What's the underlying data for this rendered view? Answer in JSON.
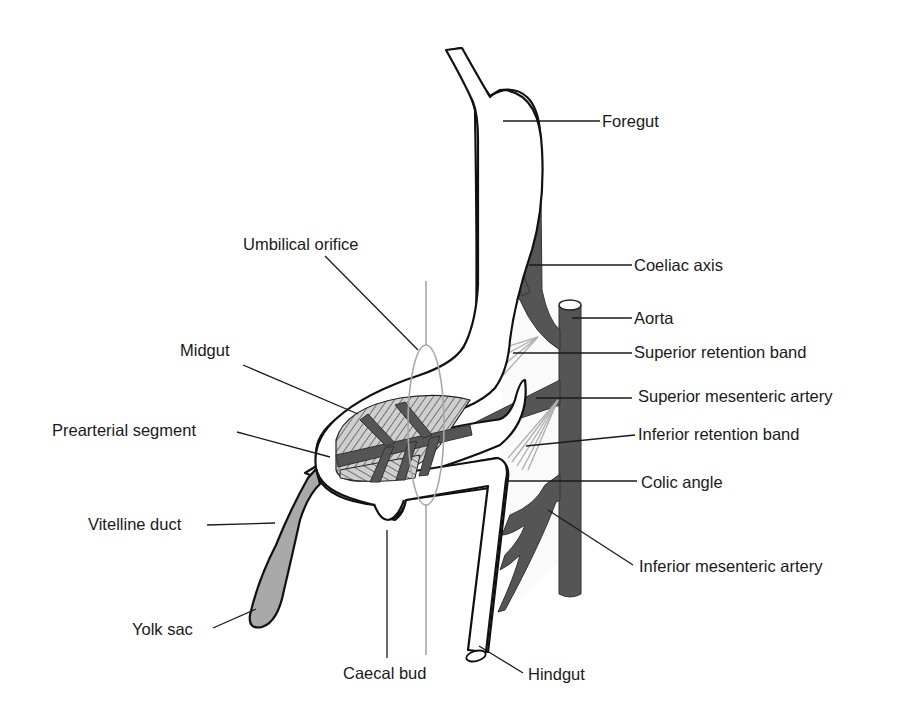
{
  "figure": {
    "colors": {
      "artery": "#555555",
      "yolk_sac": "#a9a9a9",
      "retention_band": "#b0b0b0",
      "hatched_mesentery": "#c9c9c9",
      "outline": "#111111",
      "background": "#ffffff"
    },
    "labels": {
      "foregut": "Foregut",
      "coeliac_axis": "Coeliac axis",
      "aorta": "Aorta",
      "umbilical_orifice": "Umbilical orifice",
      "midgut": "Midgut",
      "superior_retention_band": "Superior retention band",
      "superior_mesenteric_artery": "Superior mesenteric artery",
      "prearterial_segment": "Prearterial segment",
      "inferior_retention_band": "Inferior retention band",
      "colic_angle": "Colic angle",
      "vitelline_duct": "Vitelline duct",
      "inferior_mesenteric_artery": "Inferior mesenteric artery",
      "yolk_sac": "Yolk sac",
      "caecal_bud": "Caecal bud",
      "hindgut": "Hindgut"
    }
  }
}
